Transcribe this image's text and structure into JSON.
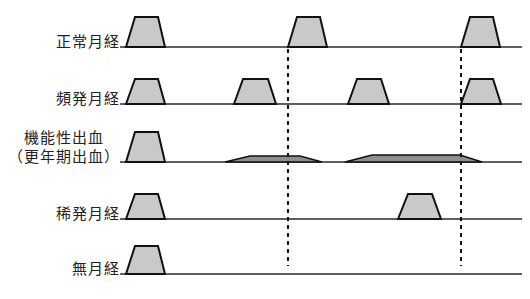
{
  "figure": {
    "baseline_color": "#2b2b2b",
    "pulse_fill": "#c9c9c9",
    "pulse_stroke": "#111111",
    "flat_fill": "#8f8f8f",
    "divider_color": "#111111"
  },
  "axis": {
    "x_start": 120,
    "x_end": 522,
    "divider_positions": [
      288,
      461
    ]
  },
  "rows": [
    {
      "id": "normal",
      "label_lines": [
        "正常月経"
      ],
      "baseline_y": 47,
      "events": [
        {
          "kind": "trapezoid",
          "x0": 126,
          "x1": 165,
          "top_x0": 135,
          "top_x1": 158,
          "height": 30
        },
        {
          "kind": "trapezoid",
          "x0": 288,
          "x1": 327,
          "top_x0": 297,
          "top_x1": 320,
          "height": 30
        },
        {
          "kind": "trapezoid",
          "x0": 461,
          "x1": 500,
          "top_x0": 470,
          "top_x1": 493,
          "height": 30
        }
      ]
    },
    {
      "id": "frequent",
      "label_lines": [
        "頻発月経"
      ],
      "baseline_y": 104,
      "events": [
        {
          "kind": "trapezoid",
          "x0": 126,
          "x1": 165,
          "top_x0": 135,
          "top_x1": 158,
          "height": 25
        },
        {
          "kind": "trapezoid",
          "x0": 234,
          "x1": 276,
          "top_x0": 243,
          "top_x1": 268,
          "height": 25
        },
        {
          "kind": "trapezoid",
          "x0": 348,
          "x1": 389,
          "top_x0": 357,
          "top_x1": 381,
          "height": 25
        },
        {
          "kind": "trapezoid",
          "x0": 461,
          "x1": 501,
          "top_x0": 470,
          "top_x1": 493,
          "height": 25
        }
      ]
    },
    {
      "id": "dysfunctional",
      "label_lines": [
        "機能性出血",
        "（更年期出血）"
      ],
      "baseline_y": 162,
      "events": [
        {
          "kind": "trapezoid",
          "x0": 126,
          "x1": 165,
          "top_x0": 135,
          "top_x1": 158,
          "height": 30
        },
        {
          "kind": "flat",
          "x0": 225,
          "x1": 322,
          "top_x0": 250,
          "top_x1": 300,
          "height": 6
        },
        {
          "kind": "flat",
          "x0": 345,
          "x1": 482,
          "top_x0": 372,
          "top_x1": 460,
          "height": 7
        }
      ]
    },
    {
      "id": "infrequent",
      "label_lines": [
        "稀発月経"
      ],
      "baseline_y": 219,
      "events": [
        {
          "kind": "trapezoid",
          "x0": 126,
          "x1": 165,
          "top_x0": 135,
          "top_x1": 158,
          "height": 25
        },
        {
          "kind": "trapezoid",
          "x0": 398,
          "x1": 441,
          "top_x0": 408,
          "top_x1": 432,
          "height": 25
        }
      ]
    },
    {
      "id": "amenorrhea",
      "label_lines": [
        "無月経"
      ],
      "baseline_y": 274,
      "events": [
        {
          "kind": "trapezoid",
          "x0": 126,
          "x1": 165,
          "top_x0": 135,
          "top_x1": 158,
          "height": 28
        }
      ]
    }
  ]
}
